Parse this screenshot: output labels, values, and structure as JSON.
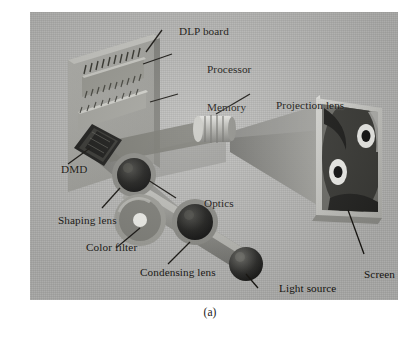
{
  "figure": {
    "caption": "(a)",
    "background_color": "#b9b9b7",
    "label_color": "#15130f"
  },
  "labels": [
    {
      "id": "dlp-board",
      "text": "DLP board",
      "x": 149,
      "y": 14
    },
    {
      "id": "processor",
      "text": "Processor",
      "x": 177,
      "y": 52
    },
    {
      "id": "memory",
      "text": "Memory",
      "x": 177,
      "y": 90
    },
    {
      "id": "projection-lens",
      "text": "Projection lens",
      "x": 246,
      "y": 88
    },
    {
      "id": "dmd",
      "text": "DMD",
      "x": 31,
      "y": 152
    },
    {
      "id": "optics",
      "text": "Optics",
      "x": 174,
      "y": 186
    },
    {
      "id": "shaping-lens",
      "text": "Shaping lens",
      "x": 28,
      "y": 203
    },
    {
      "id": "color-filter",
      "text": "Color filter",
      "x": 56,
      "y": 230
    },
    {
      "id": "condensing-lens",
      "text": "Condensing lens",
      "x": 110,
      "y": 255
    },
    {
      "id": "light-source",
      "text": "Light source",
      "x": 249,
      "y": 271
    },
    {
      "id": "screen",
      "text": "Screen",
      "x": 334,
      "y": 257
    }
  ],
  "components": {
    "dlp_board": {
      "name": "DLP circuit board",
      "color": "#a2a29e"
    },
    "processor_chip": {
      "name": "Processor chip",
      "color": "#8f8f8a"
    },
    "memory_chip": {
      "name": "Memory chip",
      "color": "#9a9a95"
    },
    "dmd_chip": {
      "name": "DMD mirror chip",
      "color": "#141414"
    },
    "shaping_lens": {
      "name": "Shaping lens",
      "color": "#1b1b1b"
    },
    "color_filter": {
      "name": "Color filter wheel",
      "color": "#8d8d88"
    },
    "condensing_lens": {
      "name": "Condensing lens",
      "color": "#1b1b1b"
    },
    "light_source": {
      "name": "Lamp bulb",
      "color": "#2a2a2a"
    },
    "projection_lens": {
      "name": "Projection lens barrel",
      "color": "#c9c9c5"
    },
    "light_beam": {
      "name": "Projected light cone",
      "color": "#7e7e7a"
    },
    "screen": {
      "name": "Projection screen",
      "color": "#d2d2ce"
    }
  }
}
